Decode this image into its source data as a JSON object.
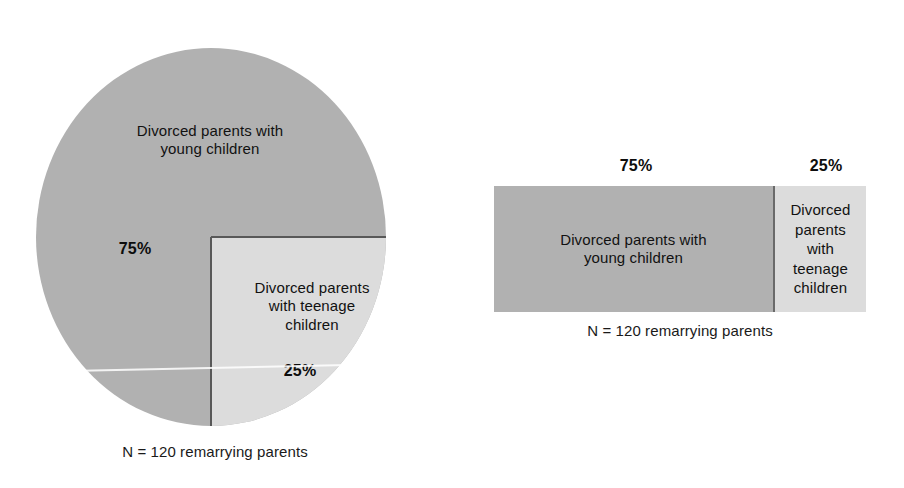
{
  "chart_data": [
    {
      "type": "pie",
      "title": "",
      "categories": [
        "Divorced parents with young children",
        "Divorced parents with teenage children"
      ],
      "values": [
        75,
        25
      ],
      "value_labels": [
        "75%",
        "25%"
      ],
      "colors": [
        "#b1b1b1",
        "#dcdcdc"
      ],
      "caption": "N = 120 remarrying parents",
      "legend": "none",
      "grid": false,
      "slice_labels": [
        "Divorced parents with\nyoung children",
        "Divorced parents\nwith teenage\nchildren"
      ]
    },
    {
      "type": "bar",
      "orientation": "horizontal-stacked",
      "title": "",
      "categories": [
        "Divorced parents with young children",
        "Divorced parents with teenage children"
      ],
      "values": [
        75,
        25
      ],
      "value_labels": [
        "75%",
        "25%"
      ],
      "colors": [
        "#b1b1b1",
        "#dcdcdc"
      ],
      "caption": "N = 120 remarrying parents",
      "legend": "none",
      "grid": false,
      "xlim": [
        0,
        100
      ],
      "segment_labels": [
        "Divorced parents with\nyoung children",
        "Divorced\nparents\nwith\nteenage\nchildren"
      ]
    }
  ],
  "pie": {
    "label_young": "Divorced parents with\nyoung children",
    "label_teenage": "Divorced parents\nwith teenage\nchildren",
    "percent_major": "75%",
    "percent_minor": "25%",
    "caption": "N = 120 remarrying parents"
  },
  "bar": {
    "label_young": "Divorced parents with\nyoung children",
    "label_teenage": "Divorced\nparents\nwith\nteenage\nchildren",
    "percent_major": "75%",
    "percent_minor": "25%",
    "caption": "N = 120 remarrying parents"
  },
  "colors": {
    "major_segment": "#b1b1b1",
    "minor_segment": "#dcdcdc",
    "outline": "#585858",
    "text": "#111111",
    "background": "#ffffff"
  }
}
